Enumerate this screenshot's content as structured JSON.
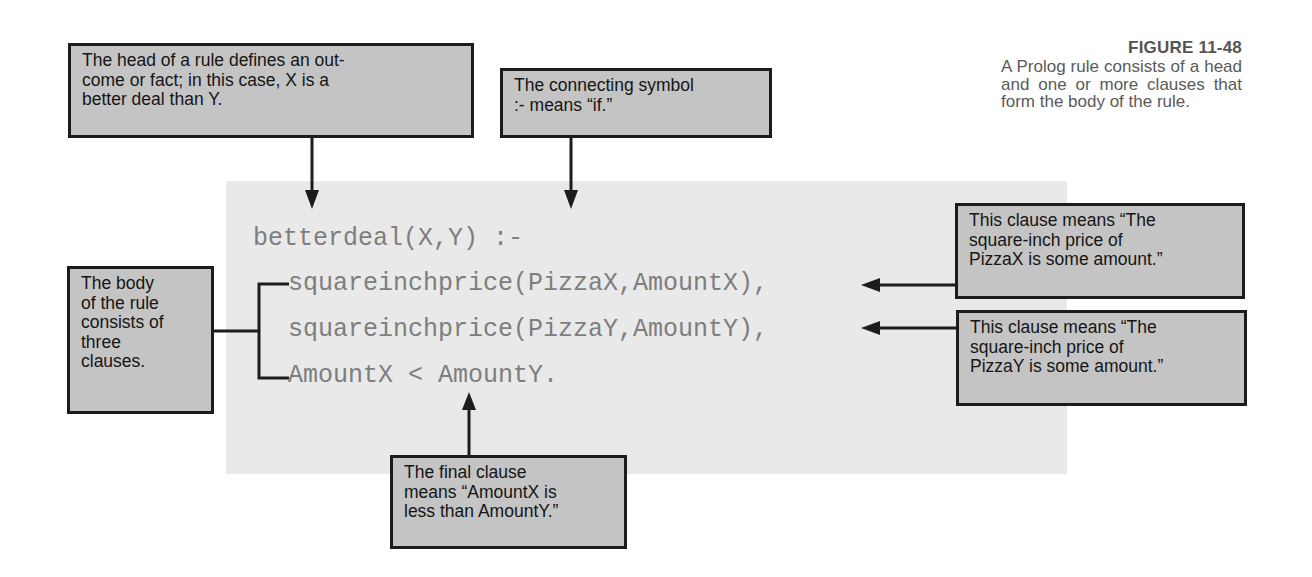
{
  "figure": {
    "number": "FIGURE 11-48",
    "caption": "A Prolog rule consists of a head and one or more clauses that form the body of the rule."
  },
  "code": {
    "lines": [
      "betterdeal(X,Y) :-",
      "squareinchprice(PizzaX,AmountX),",
      "squareinchprice(PizzaY,AmountY),",
      "AmountX < AmountY."
    ]
  },
  "callouts": {
    "head": {
      "lines": [
        "The head of a rule defines an out-",
        "come or fact; in this case, X is a",
        "better deal than Y."
      ]
    },
    "connecting_symbol": {
      "lines": [
        "The connecting symbol",
        ":- means “if.”"
      ]
    },
    "body": {
      "lines": [
        "The body",
        "of the rule",
        "consists of",
        "three",
        "clauses."
      ]
    },
    "clause_x": {
      "lines": [
        "This clause means “The",
        "square-inch price of",
        "PizzaX is some amount.”"
      ]
    },
    "clause_y": {
      "lines": [
        "This clause means “The",
        "square-inch price of",
        "PizzaY is some amount.”"
      ]
    },
    "final_clause": {
      "lines": [
        "The final clause",
        "means “AmountX is",
        "less than AmountY.”"
      ]
    }
  },
  "colors": {
    "callout_fill": "#c4c4c4",
    "callout_border": "#1c1c1c",
    "panel_fill": "#e9e9e9",
    "code_text": "#7e7e7e",
    "caption_text": "#5a5a5a"
  }
}
